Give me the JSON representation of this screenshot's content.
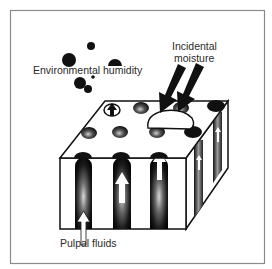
{
  "figure": {
    "type": "dentin-tubule-moisture-diagram",
    "labels": {
      "environmental_humidity": "Environmental humidity",
      "incidental_moisture_line1": "Incidental",
      "incidental_moisture_line2": "moisture",
      "pulpal_fluids": "Pulpal fluids"
    },
    "colors": {
      "frame": "#8a8a8a",
      "ink": "#111111",
      "background": "#ffffff"
    }
  }
}
